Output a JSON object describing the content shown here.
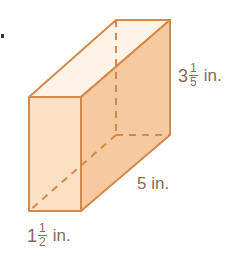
{
  "diagram": {
    "type": "rectangular-prism",
    "colors": {
      "edge": "#d4894a",
      "top_face": "#fdf3e6",
      "front_face": "#fbe0c4",
      "side_face": "#f6c9a0",
      "label": "#8a6a55"
    },
    "labels": {
      "height": {
        "whole": "3",
        "num": "1",
        "den": "5",
        "unit": "in."
      },
      "length": {
        "text": "5 in."
      },
      "width": {
        "whole": "1",
        "num": "1",
        "den": "2",
        "unit": "in."
      }
    }
  }
}
